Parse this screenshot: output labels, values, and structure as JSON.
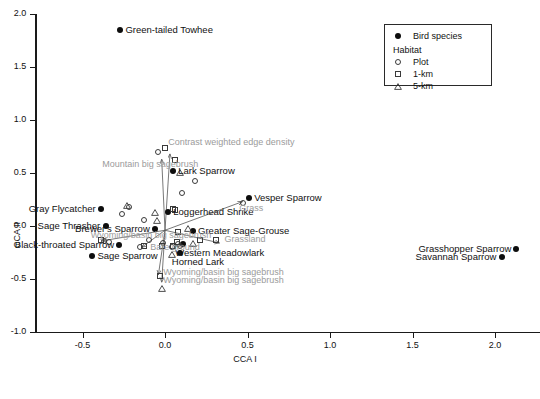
{
  "chart_data": {
    "type": "scatter",
    "title": "",
    "xlabel": "CCA I",
    "ylabel": "CCA II",
    "xlim": [
      -0.78,
      2.28
    ],
    "ylim": [
      -1.0,
      2.0
    ],
    "xticks": [
      -0.5,
      0.0,
      0.5,
      1.0,
      1.5,
      2.0
    ],
    "xticklabels": [
      "-0.5",
      "0.0",
      "0.5",
      "1.0",
      "1.5",
      "2.0"
    ],
    "yticks": [
      -1.0,
      -0.5,
      0.0,
      0.5,
      1.0,
      1.5,
      2.0
    ],
    "yticklabels": [
      "-1.0",
      "-0.5",
      "0.0",
      "0.5",
      "1.0",
      "1.5",
      "2.0"
    ],
    "grid": false,
    "legend_position": "top-right",
    "series": [
      {
        "name": "Bird species",
        "marker": "filled-circle",
        "color": "#0d0d0d",
        "points": [
          {
            "label": "Green-tailed Towhee",
            "x": -0.27,
            "y": 1.85,
            "label_side": "right"
          },
          {
            "label": "Lark Sparrow",
            "x": 0.05,
            "y": 0.52,
            "label_side": "right"
          },
          {
            "label": "Vesper Sparrow",
            "x": 0.51,
            "y": 0.26,
            "label_side": "right"
          },
          {
            "label": "Loggerhead Shrike",
            "x": 0.02,
            "y": 0.13,
            "label_side": "right"
          },
          {
            "label": "Gray Flycatcher",
            "x": -0.39,
            "y": 0.16,
            "label_side": "left"
          },
          {
            "label": "Sage Thrasher",
            "x": -0.36,
            "y": 0.0,
            "label_side": "left"
          },
          {
            "label": "Brewer's Sparrow",
            "x": -0.06,
            "y": -0.03,
            "label_side": "left"
          },
          {
            "label": "Greater Sage-Grouse",
            "x": 0.17,
            "y": -0.05,
            "label_side": "right"
          },
          {
            "label": "Black-throated Sparrow",
            "x": -0.28,
            "y": -0.18,
            "label_side": "left"
          },
          {
            "label": "Western Meadowlark",
            "x": 0.11,
            "y": -0.17,
            "label_side": "below"
          },
          {
            "label": "Horned Lark",
            "x": 0.09,
            "y": -0.25,
            "label_side": "below"
          },
          {
            "label": "Sage Sparrow",
            "x": -0.44,
            "y": -0.28,
            "label_side": "right"
          },
          {
            "label": "Grasshopper Sparrow",
            "x": 2.13,
            "y": -0.22,
            "label_side": "left"
          },
          {
            "label": "Savannah Sparrow",
            "x": 2.04,
            "y": -0.29,
            "label_side": "left"
          }
        ]
      },
      {
        "name": "Plot",
        "marker": "open-circle",
        "color": "#3a3a3a",
        "points": [
          {
            "x": -0.04,
            "y": 0.7
          },
          {
            "x": -0.22,
            "y": 0.18
          },
          {
            "x": -0.26,
            "y": 0.11
          },
          {
            "x": 0.18,
            "y": 0.42
          },
          {
            "x": -0.13,
            "y": 0.06
          },
          {
            "x": 0.1,
            "y": 0.31
          },
          {
            "x": -0.1,
            "y": -0.13
          },
          {
            "x": -0.01,
            "y": -0.16
          },
          {
            "x": -0.37,
            "y": -0.14
          },
          {
            "x": -0.34,
            "y": -0.15
          },
          {
            "x": -0.15,
            "y": -0.2
          },
          {
            "x": 0.04,
            "y": -0.2
          },
          {
            "x": 0.09,
            "y": -0.19
          },
          {
            "x": 0.47,
            "y": 0.22
          },
          {
            "x": 0.08,
            "y": -0.17
          }
        ]
      },
      {
        "name": "1-km",
        "marker": "open-square",
        "color": "#3a3a3a",
        "points": [
          {
            "x": 0.0,
            "y": 0.74
          },
          {
            "x": 0.06,
            "y": 0.62
          },
          {
            "x": 0.06,
            "y": 0.15
          },
          {
            "x": 0.05,
            "y": 0.16
          },
          {
            "x": 0.08,
            "y": -0.06
          },
          {
            "x": 0.21,
            "y": -0.13
          },
          {
            "x": 0.07,
            "y": -0.15
          },
          {
            "x": 0.05,
            "y": -0.19
          },
          {
            "x": -0.02,
            "y": -0.19
          },
          {
            "x": -0.13,
            "y": -0.19
          },
          {
            "x": -0.39,
            "y": -0.13
          },
          {
            "x": 0.31,
            "y": -0.13
          },
          {
            "x": -0.03,
            "y": -0.47
          }
        ]
      },
      {
        "name": "5-km",
        "marker": "open-triangle",
        "color": "#3a3a3a",
        "points": [
          {
            "x": 0.09,
            "y": 0.57
          },
          {
            "x": -0.23,
            "y": 0.26
          },
          {
            "x": -0.06,
            "y": 0.19
          },
          {
            "x": -0.05,
            "y": 0.12
          },
          {
            "x": 0.14,
            "y": 0.04
          },
          {
            "x": 0.17,
            "y": -0.1
          },
          {
            "x": 0.04,
            "y": -0.2
          },
          {
            "x": -0.02,
            "y": -0.52
          }
        ]
      }
    ],
    "vectors": [
      {
        "label": "Mountain big sagebrush",
        "x0": 0.0,
        "y0": -0.04,
        "x1": -0.02,
        "y1": 0.63,
        "label_x": -0.38,
        "label_y": 0.58,
        "label_anchor": "left"
      },
      {
        "label": "Contrast weighted edge density",
        "x0": 0.0,
        "y0": -0.04,
        "x1": 0.03,
        "y1": 0.68,
        "label_x": 0.02,
        "label_y": 0.78,
        "label_anchor": "left"
      },
      {
        "label": "Grass",
        "x0": 0.0,
        "y0": -0.04,
        "x1": 0.47,
        "y1": 0.23,
        "label_x": 0.45,
        "label_y": 0.16,
        "label_anchor": "left"
      },
      {
        "label": "Grassland",
        "x0": 0.0,
        "y0": -0.04,
        "x1": 0.33,
        "y1": -0.16,
        "label_x": 0.36,
        "label_y": -0.13,
        "label_anchor": "left"
      },
      {
        "label": "Wyoming/basin big sagebrush",
        "x0": 0.0,
        "y0": -0.04,
        "x1": -0.38,
        "y1": -0.14,
        "label_x": -0.45,
        "label_y": -0.09,
        "label_anchor": "left"
      },
      {
        "label": "Bare ground",
        "x0": 0.0,
        "y0": -0.04,
        "x1": -0.14,
        "y1": -0.2,
        "label_x": -0.09,
        "label_y": -0.21,
        "label_anchor": "left"
      },
      {
        "label": "Wyoming/basin big sagebrush",
        "x0": 0.0,
        "y0": -0.04,
        "x1": -0.04,
        "y1": -0.46,
        "label_x": -0.01,
        "label_y": -0.44,
        "label_anchor": "left"
      },
      {
        "label": "Wyoming/basin big sagebrush",
        "x0": 0.0,
        "y0": -0.04,
        "x1": -0.02,
        "y1": -0.53,
        "label_x": -0.01,
        "label_y": -0.52,
        "label_anchor": "left"
      }
    ]
  },
  "legend": {
    "species_label": "Bird species",
    "habitat_header": "Habitat",
    "items": [
      {
        "label": "Plot",
        "marker": "open-circle"
      },
      {
        "label": "1-km",
        "marker": "open-square"
      },
      {
        "label": "5-km",
        "marker": "open-triangle"
      }
    ]
  }
}
